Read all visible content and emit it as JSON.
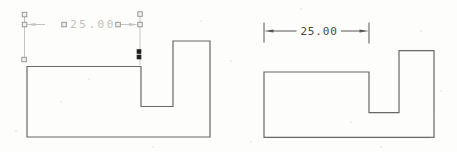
{
  "canvas": {
    "background_color": "#fdfdfc",
    "outline_color": "#686868"
  },
  "left_drawing": {
    "part": "stepped-block-profile",
    "dimension": {
      "value": "25.00",
      "state": "selected",
      "line_color": "#c4c4c4",
      "text_color": "#bfbfbf",
      "grip_border_color": "#8f8f8f",
      "grip_fill_color": "#f1f1f1",
      "hot_grip_color": "#1f1f1f"
    }
  },
  "right_drawing": {
    "part": "stepped-block-profile",
    "dimension": {
      "value": "25.00",
      "state": "normal",
      "line_color": "#565656",
      "text_color": "#474747"
    }
  }
}
